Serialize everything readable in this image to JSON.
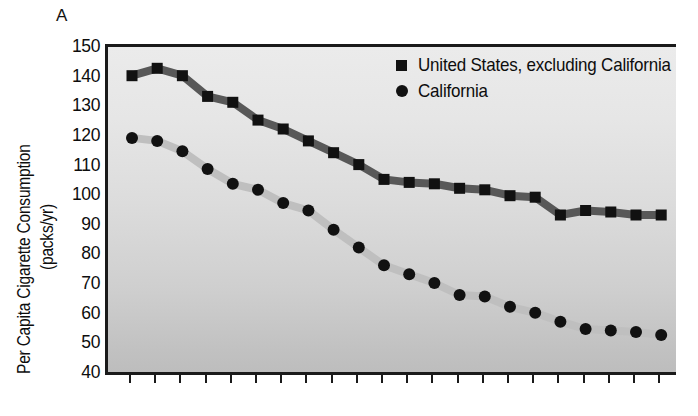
{
  "panel": {
    "label": "A"
  },
  "axes": {
    "ylabel_line1": "Per Capita Cigarette Consumption",
    "ylabel_line2": "(packs/yr)",
    "xlabel": "",
    "ytick_labels": [
      "150",
      "140",
      "130",
      "120",
      "110",
      "100",
      "90",
      "80",
      "70",
      "60",
      "50",
      "40"
    ]
  },
  "legend": {
    "position": "top-right",
    "items": [
      {
        "label": "United States, excluding California",
        "marker": "square-marker",
        "color": "#111111"
      },
      {
        "label": "California",
        "marker": "circle-marker",
        "color": "#111111"
      }
    ]
  },
  "colors": {
    "us_line": "#585858",
    "ca_line": "#bfbfbf",
    "marker": "#111111",
    "axis": "#1a1a1a",
    "plot_bg_top": "#ebebeb",
    "plot_bg_bottom": "#bdbdbd"
  },
  "chart_data": {
    "type": "line",
    "title": "",
    "subtitle": "",
    "xlabel": "",
    "ylabel": "Per Capita Cigarette Consumption (packs/yr)",
    "ylim": [
      40,
      150
    ],
    "ytick_step": 10,
    "yticks": [
      40,
      50,
      60,
      70,
      80,
      90,
      100,
      110,
      120,
      130,
      140,
      150
    ],
    "grid": false,
    "x_tick_count": 22,
    "x_tick_labels": [],
    "legend_position": "top-right",
    "series": [
      {
        "name": "United States, excluding California",
        "marker": "square",
        "color": "#111111",
        "line_color": "#585858",
        "values": [
          141,
          143.5,
          141,
          134,
          132,
          126,
          123,
          119,
          115,
          111,
          106,
          105,
          104.5,
          103,
          102.5,
          100.5,
          100,
          94,
          95.5,
          95,
          94,
          94
        ]
      },
      {
        "name": "California",
        "marker": "circle",
        "color": "#111111",
        "line_color": "#bfbfbf",
        "values": [
          120,
          119,
          115.5,
          109.5,
          104.5,
          102.5,
          98,
          95.5,
          89,
          83,
          77,
          74,
          71,
          67,
          66.5,
          63,
          61,
          58,
          55.5,
          55,
          54.5,
          53.5
        ]
      }
    ]
  }
}
